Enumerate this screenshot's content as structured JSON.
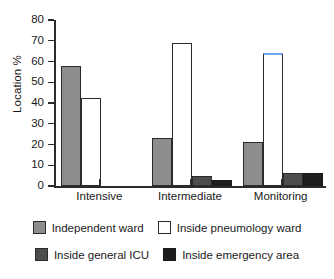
{
  "chart_data": {
    "type": "bar",
    "title": "",
    "subtitle": "",
    "xlabel": "",
    "ylabel": "Location %",
    "ylim": [
      0,
      80
    ],
    "yticks": [
      0,
      10,
      20,
      30,
      40,
      50,
      60,
      70,
      80
    ],
    "ytick_labels": [
      "0",
      "10",
      "20",
      "30",
      "40",
      "50",
      "60",
      "70",
      "80"
    ],
    "grid": false,
    "legend_position": "bottom",
    "categories": [
      "Intensive",
      "Intermediate",
      "Monitoring"
    ],
    "series": [
      {
        "name": "Independent ward",
        "color": "#8d8d8d",
        "values": [
          58,
          23,
          21
        ]
      },
      {
        "name": "Inside pneumology ward",
        "color": "#ffffff",
        "values": [
          42.5,
          69,
          64
        ]
      },
      {
        "name": "Inside general ICU",
        "color": "#4d4d4d",
        "values": [
          0,
          5,
          6.5
        ]
      },
      {
        "name": "Inside emergency area",
        "color": "#1e1e1e",
        "values": [
          0,
          3,
          6.5
        ]
      }
    ],
    "annotations": [
      {
        "target": "Monitoring / Inside pneumology ward",
        "kind": "highlighted-bar-top",
        "color": "#6fa8f5"
      }
    ]
  },
  "legend": {
    "rows": [
      [
        {
          "label": "Independent ward",
          "swatch": "series-independent"
        },
        {
          "label": "Inside pneumology ward",
          "swatch": "series-pneumology"
        }
      ],
      [
        {
          "label": "Inside general ICU",
          "swatch": "series-icu"
        },
        {
          "label": "Inside emergency area",
          "swatch": "series-emergency"
        }
      ]
    ]
  }
}
